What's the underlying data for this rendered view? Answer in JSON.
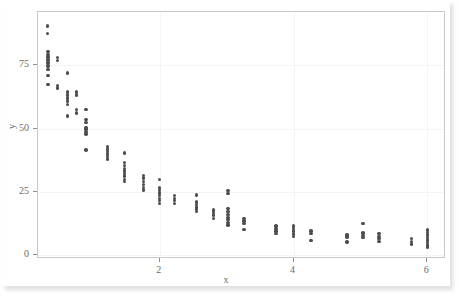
{
  "chart_data": {
    "type": "scatter",
    "title": "",
    "subtitle": "",
    "xlabel": "x",
    "ylabel": "y",
    "xlim": [
      0.18,
      6.28
    ],
    "ylim": [
      -1.5,
      96
    ],
    "xticks": [
      2,
      4,
      6
    ],
    "yticks": [
      0,
      25,
      50,
      75
    ],
    "grid": true,
    "legend": null,
    "marker": {
      "shape": "circle",
      "color": "#4d4d4d",
      "size": 3.4
    },
    "points": [
      [
        0.32,
        90.5
      ],
      [
        0.32,
        87.5
      ],
      [
        0.33,
        80.5
      ],
      [
        0.33,
        79.3
      ],
      [
        0.33,
        78.2
      ],
      [
        0.33,
        77.0
      ],
      [
        0.33,
        75.8
      ],
      [
        0.33,
        74.7
      ],
      [
        0.33,
        73.4
      ],
      [
        0.33,
        71.0
      ],
      [
        0.33,
        67.3
      ],
      [
        0.47,
        78.0
      ],
      [
        0.47,
        76.8
      ],
      [
        0.47,
        67.0
      ],
      [
        0.47,
        66.0
      ],
      [
        0.62,
        72.0
      ],
      [
        0.62,
        64.5
      ],
      [
        0.62,
        63.3
      ],
      [
        0.62,
        62.0
      ],
      [
        0.62,
        60.8
      ],
      [
        0.62,
        59.5
      ],
      [
        0.62,
        55.0
      ],
      [
        0.76,
        64.5
      ],
      [
        0.76,
        63.3
      ],
      [
        0.76,
        57.5
      ],
      [
        0.76,
        56.2
      ],
      [
        0.9,
        57.5
      ],
      [
        0.9,
        53.5
      ],
      [
        0.9,
        52.5
      ],
      [
        0.9,
        50.5
      ],
      [
        0.9,
        49.8
      ],
      [
        0.9,
        48.8
      ],
      [
        0.9,
        47.8
      ],
      [
        0.9,
        41.5
      ],
      [
        1.22,
        43.0
      ],
      [
        1.22,
        42.0
      ],
      [
        1.22,
        41.0
      ],
      [
        1.22,
        40.0
      ],
      [
        1.22,
        39.0
      ],
      [
        1.22,
        38.0
      ],
      [
        1.47,
        40.3
      ],
      [
        1.47,
        36.5
      ],
      [
        1.47,
        35.3
      ],
      [
        1.47,
        34.2
      ],
      [
        1.47,
        33.2
      ],
      [
        1.47,
        32.2
      ],
      [
        1.47,
        31.2
      ],
      [
        1.47,
        30.0
      ],
      [
        1.47,
        29.0
      ],
      [
        1.76,
        31.5
      ],
      [
        1.76,
        30.5
      ],
      [
        1.76,
        29.0
      ],
      [
        1.76,
        27.8
      ],
      [
        1.76,
        26.8
      ],
      [
        1.76,
        25.8
      ],
      [
        2.0,
        29.8
      ],
      [
        2.0,
        26.5
      ],
      [
        2.0,
        25.5
      ],
      [
        2.0,
        24.5
      ],
      [
        2.0,
        23.5
      ],
      [
        2.0,
        22.5
      ],
      [
        2.0,
        21.5
      ],
      [
        2.0,
        20.3
      ],
      [
        2.22,
        23.5
      ],
      [
        2.22,
        22.5
      ],
      [
        2.22,
        21.5
      ],
      [
        2.22,
        20.5
      ],
      [
        2.55,
        23.8
      ],
      [
        2.55,
        21.0
      ],
      [
        2.55,
        20.0
      ],
      [
        2.55,
        19.0
      ],
      [
        2.55,
        18.2
      ],
      [
        2.55,
        17.2
      ],
      [
        2.8,
        17.8
      ],
      [
        2.8,
        16.8
      ],
      [
        2.8,
        15.8
      ],
      [
        2.8,
        14.5
      ],
      [
        3.02,
        25.5
      ],
      [
        3.02,
        24.3
      ],
      [
        3.02,
        18.5
      ],
      [
        3.02,
        17.2
      ],
      [
        3.02,
        16.0
      ],
      [
        3.02,
        15.0
      ],
      [
        3.02,
        14.0
      ],
      [
        3.02,
        13.0
      ],
      [
        3.02,
        12.0
      ],
      [
        3.26,
        14.5
      ],
      [
        3.26,
        13.5
      ],
      [
        3.26,
        12.5
      ],
      [
        3.26,
        10.2
      ],
      [
        3.74,
        11.5
      ],
      [
        3.74,
        10.6
      ],
      [
        3.74,
        9.5
      ],
      [
        3.74,
        8.5
      ],
      [
        4.0,
        11.5
      ],
      [
        4.0,
        10.5
      ],
      [
        4.0,
        9.5
      ],
      [
        4.0,
        8.3
      ],
      [
        4.0,
        7.5
      ],
      [
        4.26,
        9.5
      ],
      [
        4.26,
        8.6
      ],
      [
        4.26,
        5.8
      ],
      [
        4.8,
        8.0
      ],
      [
        4.8,
        7.2
      ],
      [
        4.8,
        5.2
      ],
      [
        5.04,
        12.5
      ],
      [
        5.04,
        8.8
      ],
      [
        5.04,
        7.8
      ],
      [
        5.04,
        7.0
      ],
      [
        5.28,
        8.5
      ],
      [
        5.28,
        7.5
      ],
      [
        5.28,
        6.5
      ],
      [
        5.28,
        5.5
      ],
      [
        5.76,
        6.5
      ],
      [
        5.76,
        5.5
      ],
      [
        5.76,
        4.5
      ],
      [
        6.0,
        10.0
      ],
      [
        6.0,
        9.0
      ],
      [
        6.0,
        8.0
      ],
      [
        6.0,
        7.0
      ],
      [
        6.0,
        6.0
      ],
      [
        6.0,
        5.0
      ],
      [
        6.0,
        4.0
      ],
      [
        6.0,
        3.2
      ]
    ]
  },
  "axes": {
    "y_title": "y",
    "x_title": "x",
    "y_tick_labels": [
      "0",
      "25",
      "50",
      "75"
    ],
    "x_tick_labels": [
      "2",
      "4",
      "6"
    ]
  },
  "style": {
    "marker_color": "#4d4d4d",
    "frame_color": "#c9c9c9",
    "grid_color": "#f4f4f4",
    "tick_text_color": "#6b6b6b",
    "background": "#ffffff"
  }
}
